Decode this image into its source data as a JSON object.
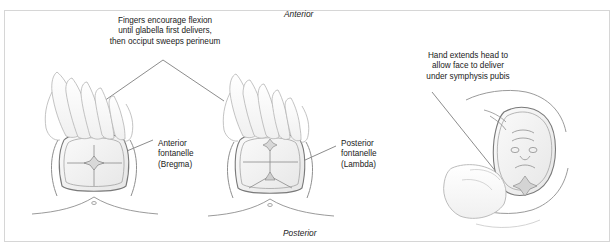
{
  "figure": {
    "background_color": "#ffffff",
    "border_color": "#d6d6d6",
    "ink_color": "#6e6e6e",
    "text_color": "#1a1a1a"
  },
  "orientation": {
    "top_label": "Anterior",
    "bottom_label": "Posterior"
  },
  "captions": {
    "flexion": "Fingers encourage flexion\nuntil glabella first delivers,\nthen occiput sweeps perineum",
    "extension": "Hand extends head to\nallow face to deliver\nunder symphysis pubis"
  },
  "labels": {
    "anterior_fontanelle": "Anterior\nfontanelle\n(Bregma)",
    "posterior_fontanelle": "Posterior\nfontanelle\n(Lambda)"
  },
  "panels": [
    {
      "id": "panel-left",
      "name": "flexion-panel-anterior-fontanelle",
      "description": "Crowning fetal head viewed from above with clinician fingers pressing on the occiput; anterior fontanelle visible",
      "landmark": "Anterior fontanelle (Bregma)"
    },
    {
      "id": "panel-middle",
      "name": "flexion-panel-posterior-fontanelle",
      "description": "Crowning fetal head with clinician fingers maintaining flexion; posterior fontanelle visible",
      "landmark": "Posterior fontanelle (Lambda)"
    },
    {
      "id": "panel-right",
      "name": "extension-panel-face-delivery",
      "description": "Fetal face delivering over the perineum while a hand extends the head under the symphysis pubis",
      "landmark": "Face"
    }
  ]
}
